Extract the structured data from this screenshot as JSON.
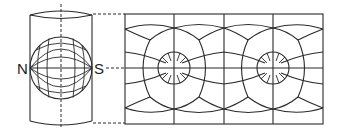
{
  "figure": {
    "labels": {
      "north_pole": "N",
      "south_pole": "S"
    },
    "colors": {
      "line": "#2a2a2a",
      "background": "#ffffff"
    },
    "cylinder": {
      "left": 30,
      "right": 92,
      "top": 14,
      "bottom": 123
    },
    "globe": {
      "cx": 61,
      "cy": 68,
      "r": 31
    },
    "map": {
      "left": 125,
      "right": 323,
      "top": 14,
      "bottom": 124,
      "vertical_gridlines_x": [
        174,
        224,
        273
      ],
      "pole_centers_x": [
        174,
        273
      ],
      "equator_y": 68
    }
  }
}
